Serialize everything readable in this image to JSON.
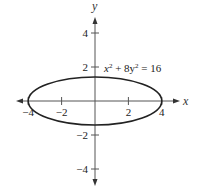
{
  "chart_data": {
    "type": "line",
    "title": "",
    "xlabel": "x",
    "ylabel": "y",
    "xlim": [
      -5,
      5
    ],
    "ylim": [
      -5,
      5
    ],
    "grid": false,
    "x_ticks": [
      -4,
      -2,
      2,
      4
    ],
    "x_tick_labels": [
      "−4",
      "−2",
      "2",
      "4"
    ],
    "y_ticks": [
      4,
      2,
      -2,
      -4
    ],
    "y_tick_labels": [
      "4",
      "2",
      "−2",
      "−4"
    ],
    "series": [
      {
        "name": "ellipse",
        "equation": "x² + 8y² = 16",
        "semi_major_x": 4,
        "semi_minor_y": 1.414,
        "center": [
          0,
          0
        ]
      }
    ],
    "annotations": [
      {
        "text_main": "x",
        "sup1": "2",
        "mid": " + 8y",
        "sup2": "2",
        "tail": " = 16",
        "anchor": [
          0.5,
          2
        ]
      }
    ]
  }
}
